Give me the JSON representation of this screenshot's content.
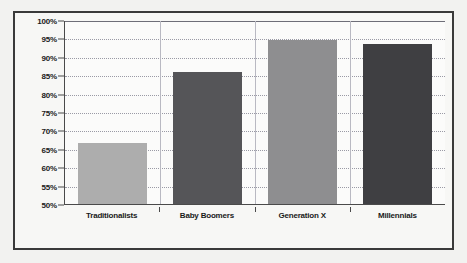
{
  "chart_data": {
    "type": "bar",
    "title": "",
    "subtitle": "",
    "xlabel": "",
    "ylabel": "",
    "categories": [
      "Traditionalists",
      "Baby Boomers",
      "Generation X",
      "Millennials"
    ],
    "values": [
      66.5,
      86,
      94.5,
      93.5
    ],
    "value_labels": [
      "",
      "",
      "",
      ""
    ],
    "bar_colors": [
      "#adadad",
      "#555558",
      "#8e8e90",
      "#3f3f42"
    ],
    "ylim": [
      50,
      100
    ],
    "ytick_step": 5,
    "yticks": [
      100,
      95,
      90,
      85,
      80,
      75,
      70,
      65,
      60,
      55,
      50
    ],
    "ytick_labels": [
      "100%",
      "95%",
      "90%",
      "85%",
      "80%",
      "75%",
      "70%",
      "65%",
      "60%",
      "55%",
      "50%"
    ],
    "grid": true,
    "grid_axis": "y",
    "legend": false,
    "legend_position": "none"
  },
  "style": {
    "page_background": "#f2f2f0",
    "plot_background": "#fbfbfa",
    "frame_color": "#3a3a3a",
    "axis_color": "#4a4a4a",
    "gridline_color": "#9a9aa5",
    "divider_color": "#b9b9c2",
    "label_color": "#1a1a1a"
  }
}
